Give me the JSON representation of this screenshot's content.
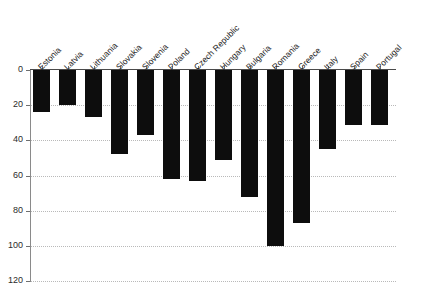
{
  "chart_data": {
    "type": "bar",
    "title": "",
    "subtitle": "",
    "xlabel": "",
    "ylabel": "",
    "orientation": "vertical",
    "grid": true,
    "legend": null,
    "axis_note": "Y axis is inverted: values increase downward from 0 at top to 120 at bottom; bars hang down from the zero line.",
    "categories": [
      "Estonia",
      "Latvia",
      "Lithuania",
      "Slovakia",
      "Slovenia",
      "Poland",
      "Czech Republic",
      "Hungary",
      "Bulgaria",
      "Romania",
      "Greece",
      "Italy",
      "Spain",
      "Portugal"
    ],
    "values": [
      24,
      20,
      27,
      48,
      37,
      62,
      63,
      51,
      72,
      100,
      87,
      45,
      31,
      31
    ],
    "ylim": [
      0,
      120
    ],
    "yticks": [
      0,
      20,
      40,
      60,
      80,
      100,
      120
    ],
    "ytick_labels": [
      "0",
      "20",
      "40",
      "60",
      "80",
      "100",
      "120"
    ],
    "bar_color": "#0d0d0d",
    "grid_color": "#b9b9b9"
  }
}
